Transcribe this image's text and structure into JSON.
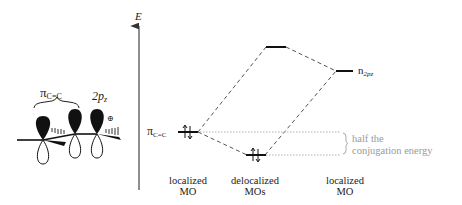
{
  "diagram": {
    "axis_label": "E",
    "molecule": {
      "pi_label_main": "π",
      "pi_label_sub": "C=C",
      "p_label_main": "2p",
      "p_label_sub": "z",
      "charge_symbol": "⊕"
    },
    "levels": {
      "pi_cc_label_main": "π",
      "pi_cc_label_sub": "C=C",
      "n_label_main": "n",
      "n_label_sub": "2pz"
    },
    "annotation": {
      "line1": "half the",
      "line2": "conjugation energy"
    },
    "columns": [
      {
        "line1": "localized",
        "line2": "MO"
      },
      {
        "line1": "delocalized",
        "line2": "MOs"
      },
      {
        "line1": "localized",
        "line2": "MO"
      }
    ],
    "colors": {
      "ink": "#111111",
      "dashed": "#555555",
      "dotted": "#b0b0b0",
      "annotation_text": "#9a9a9a"
    }
  }
}
